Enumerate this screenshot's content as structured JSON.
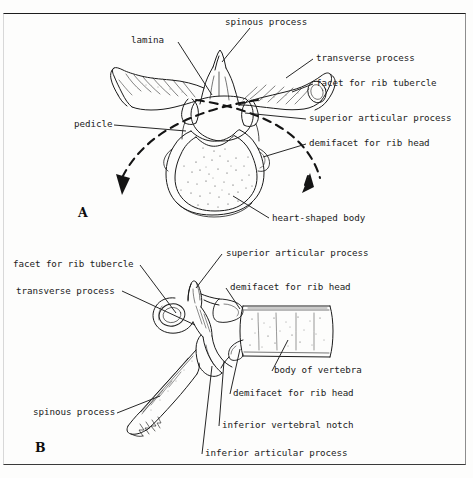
{
  "figure": {
    "background_color": "#fdfdfc",
    "ink_color": "#1b1b1b",
    "panels": [
      {
        "letter": "A",
        "view": "superior view of a thoracic vertebra",
        "labels": [
          "spinous process",
          "lamina",
          "transverse process",
          "facet for rib tubercle",
          "superior articular process",
          "demifacet for rib head",
          "pedicle",
          "heart-shaped body"
        ]
      },
      {
        "letter": "B",
        "view": "lateral view of a thoracic vertebra",
        "labels": [
          "facet for rib tubercle",
          "transverse process",
          "superior articular process",
          "demifacet for rib head",
          "body of vertebra",
          "demifacet for rib head",
          "inferior vertebral notch",
          "inferior articular process",
          "spinous process"
        ]
      }
    ]
  },
  "panel_a": {
    "letter": "A",
    "spinous_process": "spinous process",
    "lamina": "lamina",
    "transverse_process": "transverse process",
    "facet_for_rib_tubercle": "facet for rib tubercle",
    "superior_articular_process": "superior articular process",
    "demifacet_for_rib_head": "demifacet for rib head",
    "pedicle": "pedicle",
    "heart_shaped_body": "heart-shaped body"
  },
  "panel_b": {
    "letter": "B",
    "facet_for_rib_tubercle": "facet for rib tubercle",
    "transverse_process": "transverse process",
    "superior_articular_process": "superior articular process",
    "demifacet_for_rib_head_upper": "demifacet for rib head",
    "body_of_vertebra": "body of vertebra",
    "demifacet_for_rib_head_lower": "demifacet for rib head",
    "inferior_vertebral_notch": "inferior vertebral notch",
    "inferior_articular_process": "inferior articular process",
    "spinous_process": "spinous process"
  }
}
